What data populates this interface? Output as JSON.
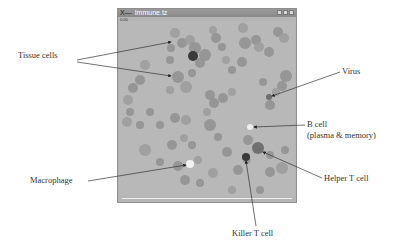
{
  "window": {
    "title_prefix": "X—",
    "title": "Immune.tz",
    "subtitle": "0.00",
    "controls": [
      "minimize",
      "maximize",
      "close"
    ]
  },
  "labels": {
    "tissue_cells": "Tissue cells",
    "virus": "Virus",
    "b_cell_line1": "B cell",
    "b_cell_line2": "(plasma & memory)",
    "macrophage": "Macrophage",
    "helper_t_cell": "Helper T cell",
    "killer_t_cell": "Killer T cell"
  },
  "colors": {
    "background": "#b8b8b8",
    "tissue_cell": "#8f8f8f",
    "tissue_cell_light": "#9b9b9b",
    "killer_t": "#3a3a3a",
    "helper_t": "#707070",
    "macrophage": "#f2f2f2",
    "b_cell": "#eeeeee",
    "virus": "#6e6e6e"
  },
  "cells": [
    {
      "type": "tissue",
      "x": 175,
      "y": 33,
      "r": 5
    },
    {
      "type": "tissue",
      "x": 182,
      "y": 43,
      "r": 5
    },
    {
      "type": "tissue",
      "x": 171,
      "y": 48,
      "r": 4
    },
    {
      "type": "tissue",
      "x": 190,
      "y": 40,
      "r": 5
    },
    {
      "type": "tissue",
      "x": 195,
      "y": 48,
      "r": 6
    },
    {
      "type": "tissue",
      "x": 205,
      "y": 55,
      "r": 6
    },
    {
      "type": "tissue",
      "x": 213,
      "y": 30,
      "r": 4
    },
    {
      "type": "tissue",
      "x": 216,
      "y": 38,
      "r": 5
    },
    {
      "type": "tissue",
      "x": 222,
      "y": 47,
      "r": 4
    },
    {
      "type": "tissue",
      "x": 226,
      "y": 60,
      "r": 4
    },
    {
      "type": "tissue",
      "x": 200,
      "y": 63,
      "r": 5
    },
    {
      "type": "tissue",
      "x": 170,
      "y": 60,
      "r": 4
    },
    {
      "type": "tissue",
      "x": 145,
      "y": 65,
      "r": 5
    },
    {
      "type": "tissue",
      "x": 178,
      "y": 77,
      "r": 6
    },
    {
      "type": "tissue",
      "x": 192,
      "y": 73,
      "r": 4
    },
    {
      "type": "tissue",
      "x": 186,
      "y": 87,
      "r": 6
    },
    {
      "type": "tissue",
      "x": 140,
      "y": 80,
      "r": 5
    },
    {
      "type": "tissue",
      "x": 133,
      "y": 88,
      "r": 5
    },
    {
      "type": "tissue",
      "x": 128,
      "y": 100,
      "r": 5
    },
    {
      "type": "tissue",
      "x": 130,
      "y": 112,
      "r": 4
    },
    {
      "type": "tissue",
      "x": 150,
      "y": 112,
      "r": 4
    },
    {
      "type": "tissue",
      "x": 170,
      "y": 90,
      "r": 4
    },
    {
      "type": "tissue",
      "x": 210,
      "y": 95,
      "r": 5
    },
    {
      "type": "tissue",
      "x": 214,
      "y": 103,
      "r": 5
    },
    {
      "type": "tissue",
      "x": 207,
      "y": 112,
      "r": 4
    },
    {
      "type": "tissue",
      "x": 242,
      "y": 62,
      "r": 5
    },
    {
      "type": "tissue",
      "x": 232,
      "y": 70,
      "r": 4
    },
    {
      "type": "tissue",
      "x": 243,
      "y": 28,
      "r": 5
    },
    {
      "type": "tissue",
      "x": 245,
      "y": 43,
      "r": 6
    },
    {
      "type": "tissue",
      "x": 256,
      "y": 40,
      "r": 5
    },
    {
      "type": "tissue",
      "x": 259,
      "y": 47,
      "r": 5
    },
    {
      "type": "tissue",
      "x": 269,
      "y": 52,
      "r": 5
    },
    {
      "type": "tissue",
      "x": 278,
      "y": 32,
      "r": 5
    },
    {
      "type": "tissue",
      "x": 284,
      "y": 38,
      "r": 5
    },
    {
      "type": "tissue",
      "x": 286,
      "y": 76,
      "r": 6
    },
    {
      "type": "tissue",
      "x": 282,
      "y": 86,
      "r": 5
    },
    {
      "type": "tissue",
      "x": 276,
      "y": 92,
      "r": 4
    },
    {
      "type": "tissue",
      "x": 263,
      "y": 82,
      "r": 4
    },
    {
      "type": "tissue",
      "x": 270,
      "y": 105,
      "r": 5
    },
    {
      "type": "tissue",
      "x": 232,
      "y": 92,
      "r": 4
    },
    {
      "type": "tissue",
      "x": 223,
      "y": 98,
      "r": 5
    },
    {
      "type": "tissue",
      "x": 140,
      "y": 125,
      "r": 4
    },
    {
      "type": "tissue",
      "x": 127,
      "y": 122,
      "r": 5
    },
    {
      "type": "tissue",
      "x": 160,
      "y": 125,
      "r": 4
    },
    {
      "type": "tissue",
      "x": 175,
      "y": 118,
      "r": 5
    },
    {
      "type": "tissue",
      "x": 186,
      "y": 120,
      "r": 5
    },
    {
      "type": "tissue",
      "x": 210,
      "y": 125,
      "r": 6
    },
    {
      "type": "tissue",
      "x": 218,
      "y": 137,
      "r": 4
    },
    {
      "type": "tissue",
      "x": 184,
      "y": 138,
      "r": 4
    },
    {
      "type": "tissue",
      "x": 172,
      "y": 145,
      "r": 5
    },
    {
      "type": "tissue",
      "x": 192,
      "y": 145,
      "r": 4
    },
    {
      "type": "tissue",
      "x": 145,
      "y": 150,
      "r": 6
    },
    {
      "type": "tissue",
      "x": 160,
      "y": 162,
      "r": 4
    },
    {
      "type": "tissue",
      "x": 178,
      "y": 166,
      "r": 5
    },
    {
      "type": "tissue",
      "x": 198,
      "y": 160,
      "r": 4
    },
    {
      "type": "tissue",
      "x": 185,
      "y": 180,
      "r": 5
    },
    {
      "type": "tissue",
      "x": 200,
      "y": 183,
      "r": 4
    },
    {
      "type": "tissue",
      "x": 213,
      "y": 173,
      "r": 5
    },
    {
      "type": "tissue",
      "x": 227,
      "y": 152,
      "r": 5
    },
    {
      "type": "tissue",
      "x": 248,
      "y": 140,
      "r": 5
    },
    {
      "type": "tissue",
      "x": 247,
      "y": 160,
      "r": 4
    },
    {
      "type": "tissue",
      "x": 238,
      "y": 170,
      "r": 5
    },
    {
      "type": "tissue",
      "x": 270,
      "y": 172,
      "r": 5
    },
    {
      "type": "tissue",
      "x": 282,
      "y": 168,
      "r": 6
    },
    {
      "type": "tissue",
      "x": 285,
      "y": 150,
      "r": 4
    },
    {
      "type": "tissue",
      "x": 270,
      "y": 155,
      "r": 4
    },
    {
      "type": "tissue",
      "x": 232,
      "y": 190,
      "r": 4
    },
    {
      "type": "tissue",
      "x": 260,
      "y": 190,
      "r": 4
    },
    {
      "type": "killer_t",
      "x": 193,
      "y": 56,
      "r": 5
    },
    {
      "type": "helper_t",
      "x": 258,
      "y": 148,
      "r": 6
    },
    {
      "type": "killer_t",
      "x": 246,
      "y": 157,
      "r": 4
    },
    {
      "type": "b_cell",
      "x": 250,
      "y": 127,
      "r": 3
    },
    {
      "type": "macrophage",
      "x": 190,
      "y": 164,
      "r": 4
    },
    {
      "type": "virus",
      "x": 269,
      "y": 97,
      "r": 3
    }
  ]
}
